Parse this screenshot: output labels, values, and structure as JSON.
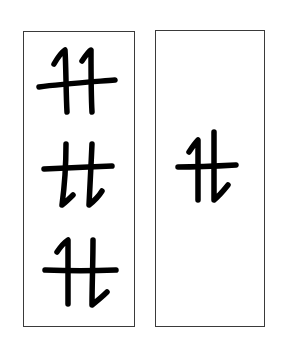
{
  "diagram": {
    "stroke_color": "#000000",
    "border_color": "#3a3a3a",
    "background_color": "#ffffff",
    "panels": [
      {
        "id": "left",
        "glyphs": [
          {
            "form": "tt-hooked-top",
            "label": "tt"
          },
          {
            "form": "tt-hooked-bottom",
            "label": "tt"
          },
          {
            "form": "tt-mixed",
            "label": "tt"
          }
        ]
      },
      {
        "id": "right",
        "glyphs": [
          {
            "form": "tt-mixed-compact",
            "label": "tt"
          }
        ]
      }
    ]
  }
}
